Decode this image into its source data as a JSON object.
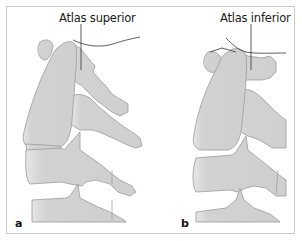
{
  "figure": {
    "panels": [
      {
        "id": "a",
        "letter": "a",
        "label": "Atlas superior"
      },
      {
        "id": "b",
        "letter": "b",
        "label": "Atlas inferior"
      }
    ]
  },
  "colors": {
    "bone_fill": "#d4d4d4",
    "bone_stroke": "#9a9a9a",
    "bone_highlight": "#f2f2f2",
    "line": "#333333",
    "frame": "#c8c8c8"
  }
}
